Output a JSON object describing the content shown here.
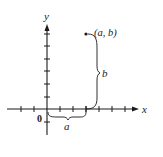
{
  "diagram": {
    "type": "coordinate-plane",
    "axes": {
      "x_label": "x",
      "y_label": "y",
      "origin_label": "0"
    },
    "point": {
      "label": "(a, b)"
    },
    "braces": {
      "horizontal_label": "a",
      "vertical_label": "b"
    },
    "colors": {
      "ink": "#1a1a1a",
      "background": "#ffffff"
    }
  }
}
